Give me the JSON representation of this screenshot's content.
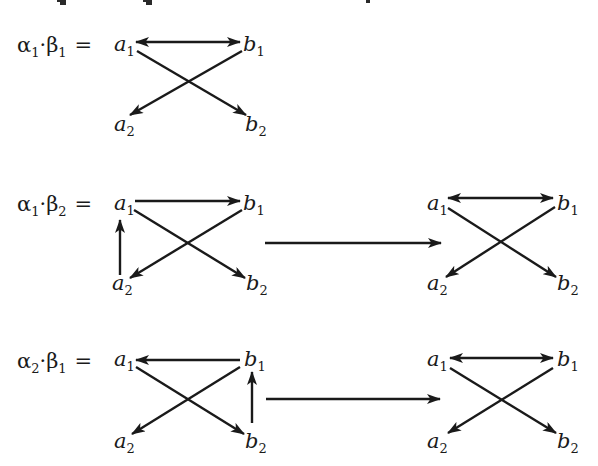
{
  "title_fragment": "",
  "rows": [
    {
      "label": {
        "alpha": "α",
        "alpha_sub": "1",
        "dot": "·",
        "beta": "β",
        "beta_sub": "1",
        "eq": "="
      },
      "left_graph": {
        "nodes": {
          "a1": "a",
          "a1_sub": "1",
          "b1": "b",
          "b1_sub": "1",
          "a2": "a",
          "a2_sub": "2",
          "b2": "b",
          "b2_sub": "2"
        },
        "edges": [
          "a1<->b1",
          "a1->b2",
          "b1->a2"
        ]
      }
    },
    {
      "label": {
        "alpha": "α",
        "alpha_sub": "1",
        "dot": "·",
        "beta": "β",
        "beta_sub": "2",
        "eq": "="
      },
      "left_graph": {
        "nodes": {
          "a1": "a",
          "a1_sub": "1",
          "b1": "b",
          "b1_sub": "1",
          "a2": "a",
          "a2_sub": "2",
          "b2": "b",
          "b2_sub": "2"
        },
        "edges": [
          "a1->b1",
          "a2->a1",
          "a1->b2",
          "b1->a2"
        ]
      },
      "transition": "reduces-to",
      "right_graph": {
        "nodes": {
          "a1": "a",
          "a1_sub": "1",
          "b1": "b",
          "b1_sub": "1",
          "a2": "a",
          "a2_sub": "2",
          "b2": "b",
          "b2_sub": "2"
        },
        "edges": [
          "a1<->b1",
          "a1->b2",
          "b1->a2"
        ]
      }
    },
    {
      "label": {
        "alpha": "α",
        "alpha_sub": "2",
        "dot": "·",
        "beta": "β",
        "beta_sub": "1",
        "eq": "="
      },
      "left_graph": {
        "nodes": {
          "a1": "a",
          "a1_sub": "1",
          "b1": "b",
          "b1_sub": "1",
          "a2": "a",
          "a2_sub": "2",
          "b2": "b",
          "b2_sub": "2"
        },
        "edges": [
          "b1->a1",
          "b2->b1",
          "a1->b2",
          "b1->a2"
        ]
      },
      "transition": "reduces-to",
      "right_graph": {
        "nodes": {
          "a1": "a",
          "a1_sub": "1",
          "b1": "b",
          "b1_sub": "1",
          "a2": "a",
          "a2_sub": "2",
          "b2": "b",
          "b2_sub": "2"
        },
        "edges": [
          "a1<->b1",
          "a1->b2",
          "b1->a2"
        ]
      }
    }
  ]
}
